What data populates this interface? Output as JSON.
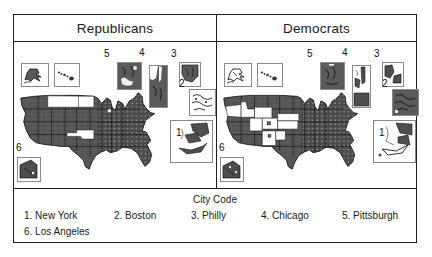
{
  "figure": {
    "panels": {
      "left": {
        "title": "Republicans"
      },
      "right": {
        "title": "Democrats"
      }
    },
    "markers": {
      "m1": "1",
      "m2": "2",
      "m3": "3",
      "m4": "4",
      "m5": "5",
      "m6": "6"
    },
    "legend": {
      "title": "City Code",
      "items": [
        {
          "label": "1. New York"
        },
        {
          "label": "2. Boston"
        },
        {
          "label": "3. Philly"
        },
        {
          "label": "4. Chicago"
        },
        {
          "label": "5. Pittsburgh"
        },
        {
          "label": "6. Los Angeles"
        }
      ]
    },
    "colors": {
      "shaded_fill": "#5a5a5a",
      "unshaded_fill": "#ffffff",
      "line": "#000000",
      "inset_border": "#8a8a8a"
    }
  }
}
